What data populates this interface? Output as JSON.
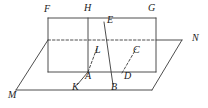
{
  "figure": {
    "width": 208,
    "height": 108,
    "background_color": "#ffffff",
    "stroke_color": "#3a3a3a",
    "label_color": "#1a1a1a",
    "dash_pattern": "2.5 2",
    "stroke_width": 0.9
  },
  "labels": [
    {
      "id": "F",
      "text": "F",
      "x": 44,
      "y": 4,
      "anchor": "vertical-plane-top-left-corner"
    },
    {
      "id": "H",
      "text": "H",
      "x": 84,
      "y": 3,
      "anchor": "vertical-plane-top-mid-corner"
    },
    {
      "id": "G",
      "text": "G",
      "x": 148,
      "y": 3,
      "anchor": "vertical-plane-top-right-corner"
    },
    {
      "id": "E",
      "text": "E",
      "x": 107,
      "y": 15,
      "anchor": "segment-eb-upper-endpoint"
    },
    {
      "id": "N",
      "text": "N",
      "x": 192,
      "y": 33,
      "anchor": "horizontal-plane-right-vertex"
    },
    {
      "id": "L",
      "text": "L",
      "x": 95,
      "y": 45,
      "anchor": "point-on-segment-kl"
    },
    {
      "id": "C",
      "text": "C",
      "x": 133,
      "y": 45,
      "anchor": "point-on-segment-dc"
    },
    {
      "id": "A",
      "text": "A",
      "x": 85,
      "y": 71,
      "anchor": "intersection-point-a"
    },
    {
      "id": "D",
      "text": "D",
      "x": 124,
      "y": 71,
      "anchor": "intersection-point-d"
    },
    {
      "id": "K",
      "text": "K",
      "x": 72,
      "y": 82,
      "anchor": "segment-kl-lower-endpoint"
    },
    {
      "id": "B",
      "text": "B",
      "x": 111,
      "y": 82,
      "anchor": "segment-eb-lower-endpoint"
    },
    {
      "id": "M",
      "text": "M",
      "x": 8,
      "y": 90,
      "anchor": "horizontal-plane-left-vertex"
    }
  ],
  "solid_segments": [
    {
      "name": "rect-top-edge-FG",
      "x1": 48,
      "y1": 18,
      "x2": 156,
      "y2": 18
    },
    {
      "name": "rect-left-edge-F",
      "x1": 48,
      "y1": 18,
      "x2": 48,
      "y2": 72
    },
    {
      "name": "rect-right-edge-G",
      "x1": 156,
      "y1": 18,
      "x2": 156,
      "y2": 72
    },
    {
      "name": "rect-bottom-edge-AD",
      "x1": 48,
      "y1": 72,
      "x2": 156,
      "y2": 72
    },
    {
      "name": "rect-mid-vertical-H",
      "x1": 88,
      "y1": 18,
      "x2": 88,
      "y2": 72
    },
    {
      "name": "plane-back-edge-to-N",
      "x1": 156,
      "y1": 40,
      "x2": 182,
      "y2": 40
    },
    {
      "name": "plane-left-edge-M",
      "x1": 16,
      "y1": 90,
      "x2": 48,
      "y2": 40
    },
    {
      "name": "plane-front-edge-M",
      "x1": 16,
      "y1": 90,
      "x2": 152,
      "y2": 90
    },
    {
      "name": "plane-right-edge-N",
      "x1": 152,
      "y1": 90,
      "x2": 182,
      "y2": 40
    },
    {
      "name": "segment-EB",
      "x1": 104,
      "y1": 22,
      "x2": 113,
      "y2": 85
    },
    {
      "name": "segment-KA",
      "x1": 77,
      "y1": 85,
      "x2": 88,
      "y2": 72
    }
  ],
  "dashed_segments": [
    {
      "name": "hidden-edge-back-plane",
      "x1": 48,
      "y1": 40,
      "x2": 156,
      "y2": 40
    },
    {
      "name": "hidden-segment-AL",
      "x1": 88,
      "y1": 72,
      "x2": 97,
      "y2": 48
    },
    {
      "name": "hidden-segment-DC",
      "x1": 122,
      "y1": 73,
      "x2": 136,
      "y2": 49
    }
  ]
}
